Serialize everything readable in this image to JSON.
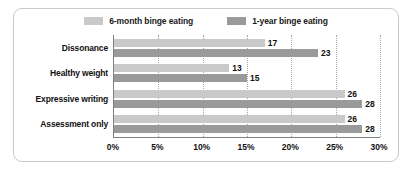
{
  "card": {
    "border_color": "#c9c9c9",
    "background": "#ffffff"
  },
  "chart_data": {
    "type": "bar",
    "orientation": "horizontal",
    "title": "",
    "subtitle": "",
    "xlabel": "",
    "ylabel": "",
    "xlim": [
      0,
      30
    ],
    "xticks": [
      0,
      5,
      10,
      15,
      20,
      25,
      30
    ],
    "xtick_labels": [
      "0%",
      "5%",
      "10%",
      "15%",
      "20%",
      "25%",
      "30%"
    ],
    "grid": true,
    "grid_axis": "x",
    "grid_style": "dotted",
    "legend_position": "top-center",
    "categories": [
      "Dissonance",
      "Healthy weight",
      "Expressive writing",
      "Assessment only"
    ],
    "series": [
      {
        "name": "6-month binge eating",
        "color": "#c9c9c9",
        "values": [
          17,
          13,
          26,
          26
        ],
        "value_labels": [
          "17",
          "13",
          "26",
          "26"
        ]
      },
      {
        "name": "1-year binge eating",
        "color": "#9a9a9a",
        "values": [
          23,
          15,
          28,
          28
        ],
        "value_labels": [
          "23",
          "15",
          "28",
          "28"
        ]
      }
    ]
  },
  "legend": {
    "entries": [
      {
        "label": "6-month binge eating",
        "color": "#c9c9c9",
        "swatch_name": "legend-swatch-6-month"
      },
      {
        "label": "1-year binge eating",
        "color": "#9a9a9a",
        "swatch_name": "legend-swatch-1-year"
      }
    ]
  }
}
